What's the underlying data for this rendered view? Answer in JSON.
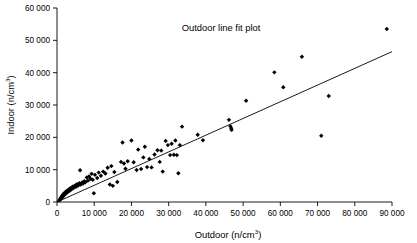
{
  "chart_data": {
    "type": "scatter",
    "title": "Outdoor line fit plot",
    "xlabel": "Outdoor (n/cm",
    "xlabel_sup": "3",
    "xlabel_tail": ")",
    "ylabel": "Indoor (n/cm",
    "ylabel_sup": "3",
    "ylabel_tail": ")",
    "xlim": [
      0,
      90000
    ],
    "ylim": [
      0,
      60000
    ],
    "grid": false,
    "legend": null,
    "xticks": [
      0,
      10000,
      20000,
      30000,
      40000,
      50000,
      60000,
      70000,
      80000,
      90000
    ],
    "xticklabels": [
      "0",
      "10 000",
      "20 000",
      "30 000",
      "40 000",
      "50 000",
      "60 000",
      "70 000",
      "80 000",
      "90 000"
    ],
    "yticks": [
      0,
      10000,
      20000,
      30000,
      40000,
      50000,
      60000
    ],
    "yticklabels": [
      "0",
      "10 000",
      "20 000",
      "30 000",
      "40 000",
      "50 000",
      "60 000"
    ],
    "series": [
      {
        "name": "Indoor vs Outdoor",
        "marker": "diamond",
        "color": "#000000",
        "points": [
          [
            600,
            500
          ],
          [
            800,
            700
          ],
          [
            900,
            1100
          ],
          [
            1000,
            900
          ],
          [
            1100,
            1400
          ],
          [
            1200,
            1200
          ],
          [
            1300,
            1800
          ],
          [
            1400,
            1500
          ],
          [
            1500,
            2100
          ],
          [
            1600,
            1700
          ],
          [
            1700,
            2400
          ],
          [
            1800,
            2000
          ],
          [
            1900,
            2600
          ],
          [
            2000,
            2300
          ],
          [
            2100,
            2900
          ],
          [
            2200,
            2500
          ],
          [
            2400,
            3100
          ],
          [
            2500,
            2800
          ],
          [
            2600,
            3400
          ],
          [
            2800,
            3000
          ],
          [
            2900,
            3600
          ],
          [
            3000,
            3300
          ],
          [
            3200,
            3900
          ],
          [
            3400,
            3500
          ],
          [
            3500,
            4200
          ],
          [
            3700,
            3800
          ],
          [
            3900,
            4400
          ],
          [
            4000,
            4100
          ],
          [
            4200,
            4700
          ],
          [
            4400,
            4300
          ],
          [
            4600,
            4900
          ],
          [
            4800,
            4600
          ],
          [
            5000,
            5200
          ],
          [
            5200,
            4800
          ],
          [
            5400,
            5500
          ],
          [
            5700,
            5100
          ],
          [
            6000,
            5800
          ],
          [
            6200,
            9800
          ],
          [
            6400,
            5400
          ],
          [
            6700,
            6000
          ],
          [
            7000,
            5700
          ],
          [
            7300,
            6400
          ],
          [
            7600,
            6100
          ],
          [
            8000,
            7600
          ],
          [
            8300,
            6600
          ],
          [
            8600,
            7900
          ],
          [
            9000,
            7200
          ],
          [
            9300,
            8700
          ],
          [
            9600,
            6900
          ],
          [
            9900,
            2700
          ],
          [
            10200,
            8400
          ],
          [
            10800,
            7400
          ],
          [
            11200,
            9100
          ],
          [
            11800,
            8100
          ],
          [
            12400,
            9400
          ],
          [
            13000,
            8800
          ],
          [
            13600,
            10600
          ],
          [
            14200,
            5400
          ],
          [
            14600,
            11100
          ],
          [
            15000,
            5000
          ],
          [
            15400,
            9300
          ],
          [
            16200,
            6200
          ],
          [
            17200,
            12400
          ],
          [
            17600,
            18400
          ],
          [
            18000,
            11900
          ],
          [
            18400,
            10300
          ],
          [
            19000,
            12600
          ],
          [
            20000,
            19000
          ],
          [
            20600,
            12300
          ],
          [
            21400,
            9900
          ],
          [
            21800,
            16200
          ],
          [
            22600,
            10200
          ],
          [
            23200,
            13800
          ],
          [
            23600,
            17100
          ],
          [
            24200,
            10800
          ],
          [
            24800,
            13300
          ],
          [
            25400,
            10700
          ],
          [
            26200,
            14700
          ],
          [
            27000,
            16000
          ],
          [
            27600,
            12400
          ],
          [
            28000,
            15900
          ],
          [
            28400,
            9400
          ],
          [
            29200,
            18900
          ],
          [
            29800,
            17600
          ],
          [
            30400,
            14500
          ],
          [
            30800,
            18000
          ],
          [
            31400,
            14600
          ],
          [
            31800,
            19000
          ],
          [
            32200,
            14500
          ],
          [
            32600,
            8900
          ],
          [
            33000,
            17600
          ],
          [
            33600,
            23300
          ],
          [
            37800,
            20800
          ],
          [
            39200,
            19100
          ],
          [
            46200,
            25400
          ],
          [
            46600,
            23400
          ],
          [
            46800,
            22800
          ],
          [
            46900,
            22300
          ],
          [
            50800,
            31300
          ],
          [
            58400,
            40100
          ],
          [
            60800,
            35500
          ],
          [
            65800,
            44900
          ],
          [
            71000,
            20500
          ],
          [
            73000,
            32800
          ],
          [
            88600,
            53500
          ]
        ]
      }
    ],
    "fit_line": {
      "name": "Linear fit",
      "x0": 0,
      "y0": 0,
      "x1": 90000,
      "y1": 46500,
      "color": "#000000"
    }
  }
}
